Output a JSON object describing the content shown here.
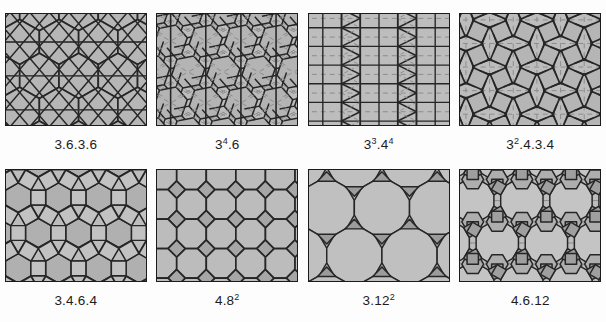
{
  "figure": {
    "title": "",
    "background_color": "#fdfdfd",
    "panel_fill": "#bdbdbd",
    "panel_border_color": "#1b1b1b",
    "edge_color": "#262626",
    "construction_line_color": "#8c8c8c",
    "caption_color": "#1c1c1c",
    "rows": 2,
    "columns": 4
  },
  "tilings": [
    {
      "index": 1,
      "name": "trihexagonal-tiling",
      "label_text": "3.6.3.6",
      "label_base": "3.6.3.6",
      "label_exponent": "",
      "pattern": "trihexagonal",
      "row": 0,
      "column": 0
    },
    {
      "index": 2,
      "name": "snub-trihexagonal-tiling",
      "label_text": "3⁴.6",
      "label_base": "3",
      "label_exponent": "4",
      "label_suffix": ".6",
      "pattern": "snub-hex",
      "row": 0,
      "column": 1
    },
    {
      "index": 3,
      "name": "elongated-triangular-tiling",
      "label_text": "3³.4⁴",
      "label_base": "3",
      "label_exponent": "3",
      "label_suffix": ".4",
      "label_exponent2": "4",
      "pattern": "elongated-triangular",
      "row": 0,
      "column": 2
    },
    {
      "index": 4,
      "name": "snub-square-tiling",
      "label_text": "3².4.3.4",
      "label_base": "3",
      "label_exponent": "2",
      "label_suffix": ".4.3.4",
      "pattern": "snub-square",
      "row": 0,
      "column": 3
    },
    {
      "index": 5,
      "name": "rhombitrihexagonal-tiling",
      "label_text": "3.4.6.4",
      "label_base": "3.4.6.4",
      "label_exponent": "",
      "pattern": "rhombitrihexagonal",
      "row": 1,
      "column": 0
    },
    {
      "index": 6,
      "name": "truncated-square-tiling",
      "label_text": "4.8²",
      "label_base": "4.8",
      "label_exponent": "2",
      "pattern": "truncated-square",
      "row": 1,
      "column": 1
    },
    {
      "index": 7,
      "name": "truncated-hexagonal-tiling",
      "label_text": "3.12²",
      "label_base": "3.12",
      "label_exponent": "2",
      "pattern": "truncated-hexagonal",
      "row": 1,
      "column": 2
    },
    {
      "index": 8,
      "name": "truncated-trihexagonal-tiling",
      "label_text": "4.6.12",
      "label_base": "4.6.12",
      "label_exponent": "",
      "pattern": "truncated-trihexagonal",
      "row": 1,
      "column": 3
    }
  ]
}
